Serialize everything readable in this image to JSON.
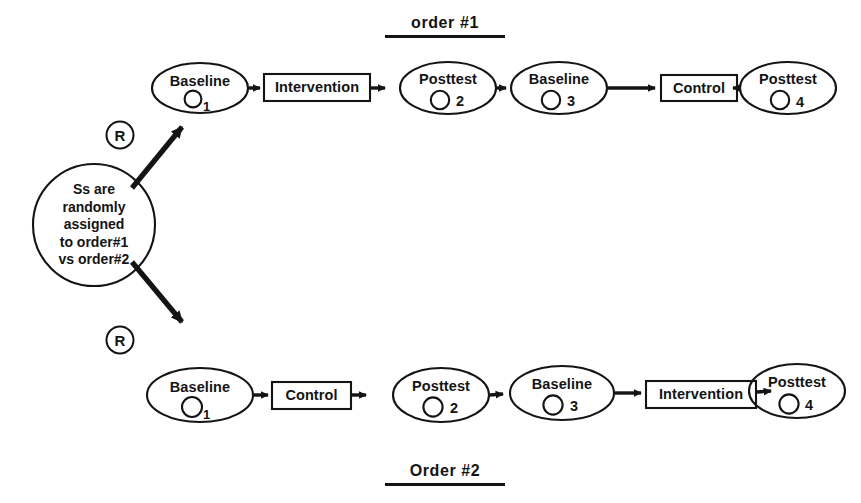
{
  "diagram": {
    "stroke_color": "#141414",
    "background_color": "#ffffff",
    "hub": {
      "lines": [
        "Ss are",
        "randomly",
        "assigned",
        "to order#1",
        "vs order#2"
      ]
    },
    "randomization_markers": [
      {
        "label": "R"
      },
      {
        "label": "R"
      }
    ],
    "headings": {
      "top": "order #1",
      "bottom": "Order #2"
    },
    "rows": [
      {
        "name": "order-1",
        "heading": "order #1",
        "nodes": [
          {
            "kind": "ellipse",
            "label": "Baseline",
            "index": "1",
            "index_style": "subscript"
          },
          {
            "kind": "box",
            "label": "Intervention",
            "index": "",
            "index_style": "none"
          },
          {
            "kind": "ellipse",
            "label": "Posttest",
            "index": "2",
            "index_style": "inline"
          },
          {
            "kind": "ellipse",
            "label": "Baseline",
            "index": "3",
            "index_style": "inline"
          },
          {
            "kind": "box",
            "label": "Control",
            "index": "",
            "index_style": "none"
          },
          {
            "kind": "ellipse",
            "label": "Posttest",
            "index": "4",
            "index_style": "inline"
          }
        ]
      },
      {
        "name": "order-2",
        "heading": "Order #2",
        "nodes": [
          {
            "kind": "ellipse",
            "label": "Baseline",
            "index": "1",
            "index_style": "subscript"
          },
          {
            "kind": "box",
            "label": "Control",
            "index": "",
            "index_style": "none"
          },
          {
            "kind": "ellipse",
            "label": "Posttest",
            "index": "2",
            "index_style": "inline"
          },
          {
            "kind": "ellipse",
            "label": "Baseline",
            "index": "3",
            "index_style": "inline"
          },
          {
            "kind": "box",
            "label": "Intervention",
            "index": "",
            "index_style": "none"
          },
          {
            "kind": "ellipse",
            "label": "Posttest",
            "index": "4",
            "index_style": "inline"
          }
        ]
      }
    ]
  }
}
